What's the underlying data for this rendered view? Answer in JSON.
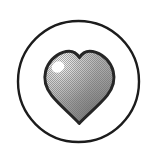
{
  "canvas": {
    "width": 156,
    "height": 157,
    "background_color": "#ffffff",
    "title": "Heart in circle icon"
  },
  "icon": {
    "name": "heart-in-circle-icon",
    "label": "Heart",
    "style": "halftone dithered grayscale clip-art",
    "alt_text": "A gray shaded heart outlined in black inside a thin black circle"
  },
  "circle": {
    "name": "outer-circle",
    "center_x": 78.5,
    "center_y": 81.5,
    "radius": 60.5,
    "stroke_color": "#1c1c1c",
    "stroke_width": 2.4,
    "fill_color": "#ffffff"
  },
  "heart": {
    "name": "heart-shape",
    "outline_color": "#262626",
    "outline_width": 3,
    "fill_light": "#c9c9c9",
    "fill_mid": "#9a9a9a",
    "fill_dark": "#7a7a7a",
    "bounds": {
      "left": 45,
      "top": 50,
      "right": 114,
      "bottom": 124
    },
    "cleft_y": 57,
    "tip_y": 123
  },
  "highlight": {
    "name": "specular-highlight",
    "color": "#ffffff",
    "center_x": 58,
    "center_y": 67,
    "radius_x": 6.5,
    "radius_y": 5.5,
    "rotation_deg": -28
  },
  "texture": {
    "name": "halftone-dither",
    "pattern": "checkerboard",
    "cell_size": 2,
    "dot_color": "#6e6e6e",
    "opacity": 0.55
  }
}
